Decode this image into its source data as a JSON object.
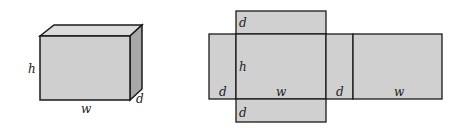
{
  "box": {
    "labels": {
      "height": "h",
      "width": "w",
      "depth": "d"
    }
  },
  "net": {
    "labels": {
      "top_flap": "d",
      "height": "h",
      "left_side": "d",
      "front_width": "w",
      "right_side": "d",
      "back_width": "w",
      "bottom_flap": "d"
    }
  },
  "colors": {
    "face": "#d0d0d0",
    "top": "#dcdcdc",
    "side": "#a8a8a8",
    "stroke": "#1a1a1a"
  }
}
